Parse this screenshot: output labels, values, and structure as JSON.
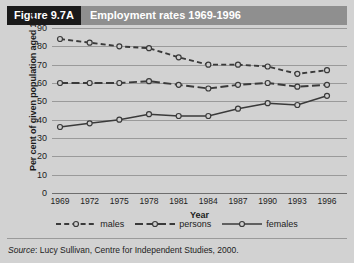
{
  "figure": {
    "number_label": "Figure 9.7A",
    "title": "Employment rates 1969-1996"
  },
  "source": {
    "prefix": "Source",
    "separator": ": ",
    "text": "Lucy Sullivan, Centre for Independent Studies, 2000."
  },
  "colors": {
    "page_background": "#d2d2d2",
    "badge_background": "#1a1a1a",
    "titlebar_background": "#8f8f8f",
    "title_text": "#ffffff",
    "gridline": "#9a9a9a",
    "series_line": "#3a3a3a",
    "marker_fill": "#cfcfcf"
  },
  "legend": {
    "position": "bottom-center",
    "entries": [
      {
        "label": "males",
        "style": "dashed",
        "marker": "open-circle"
      },
      {
        "label": "persons",
        "style": "dash-dot",
        "marker": "open-circle"
      },
      {
        "label": "females",
        "style": "solid",
        "marker": "open-circle"
      }
    ]
  },
  "chart_data": {
    "type": "line",
    "title": "Employment rates 1969-1996",
    "xlabel": "Year",
    "ylabel": "Per cent of given population aged 15+",
    "categories": [
      "1969",
      "1972",
      "1975",
      "1978",
      "1981",
      "1984",
      "1987",
      "1990",
      "1993",
      "1996"
    ],
    "x": [
      1969,
      1972,
      1975,
      1978,
      1981,
      1984,
      1987,
      1990,
      1993,
      1996
    ],
    "ylim": [
      0,
      90
    ],
    "yticks": [
      90,
      80,
      70,
      60,
      50,
      40,
      30,
      20,
      10,
      0
    ],
    "grid": true,
    "series": [
      {
        "name": "males",
        "style": "dashed",
        "values": [
          84,
          82,
          80,
          79,
          74,
          70,
          70,
          69,
          65,
          67
        ]
      },
      {
        "name": "persons",
        "style": "dash-dot",
        "values": [
          60,
          60,
          60,
          61,
          59,
          57,
          59,
          60,
          58,
          59
        ]
      },
      {
        "name": "females",
        "style": "solid",
        "values": [
          36,
          38,
          40,
          43,
          42,
          42,
          46,
          49,
          48,
          53
        ]
      }
    ]
  }
}
